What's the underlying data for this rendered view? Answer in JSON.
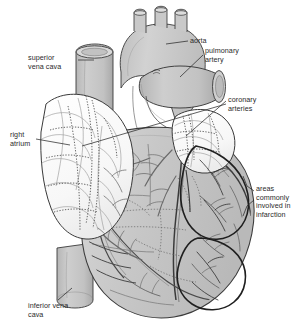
{
  "figure": {
    "background_color": "#ffffff",
    "ink_color": "#2b2b2b",
    "muscle_fill": "#c9c9c9",
    "vessel_fill": "#bdbdbd",
    "atrium_fill": "#fdfdfd",
    "label_font_size_px": 7.2
  },
  "labels": {
    "superior_vena_cava": "superior\nvena cava",
    "right_atrium": "right\natrium",
    "inferior_vena_cava": "inferior vena\ncava",
    "aorta": "aorta",
    "pulmonary_artery": "pulmonary\nartery",
    "coronary_arteries": "coronary\narteries",
    "infarction_areas": "areas\ncommonly\ninvolved in\ninfarction"
  },
  "structures": [
    {
      "name": "aorta",
      "type": "great-vessel",
      "side": "center-top",
      "shading": "gray",
      "branches": 3
    },
    {
      "name": "pulmonary-artery",
      "type": "great-vessel",
      "side": "right-upper",
      "shading": "gray"
    },
    {
      "name": "superior-vena-cava",
      "type": "great-vein",
      "side": "left-upper",
      "shading": "gray"
    },
    {
      "name": "inferior-vena-cava",
      "type": "great-vein",
      "side": "left-lower",
      "shading": "gray"
    },
    {
      "name": "right-atrium",
      "type": "chamber",
      "side": "left",
      "shading": "white-lobed"
    },
    {
      "name": "left-auricle",
      "type": "chamber",
      "side": "right-upper",
      "shading": "white-lobed"
    },
    {
      "name": "right-ventricle",
      "type": "chamber",
      "side": "center-lower",
      "shading": "gray"
    },
    {
      "name": "left-ventricle",
      "type": "chamber",
      "side": "right-lower",
      "shading": "gray"
    },
    {
      "name": "coronary-arteries",
      "type": "vessel-network",
      "shading": "dark-lines"
    },
    {
      "name": "infarction-area-upper",
      "type": "highlighted-region",
      "side": "right",
      "outline": "heavy-dark"
    },
    {
      "name": "infarction-area-lower",
      "type": "highlighted-region",
      "side": "right-lower",
      "outline": "heavy-dark"
    }
  ]
}
